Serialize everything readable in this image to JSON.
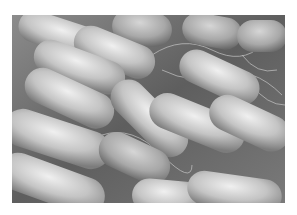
{
  "image": {
    "subject": "rod-shaped bacteria micrograph",
    "tone": "grayscale",
    "colors": {
      "background_surface": "#6e6e6e",
      "bacteria_highlight": "#e6e6e6",
      "bacteria_shadow": "#8a8a8a",
      "flagella": "#d0d0d0",
      "margin": "#ffffff"
    }
  }
}
